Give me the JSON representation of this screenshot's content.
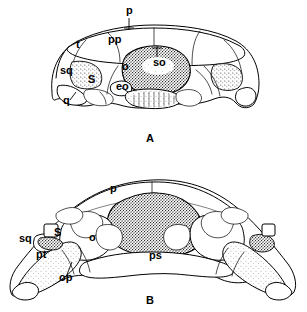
{
  "figure": {
    "background_color": "#ffffff",
    "ink_color": "#000000",
    "panels": [
      {
        "letter": "A",
        "name": "panel-a",
        "description": "Occipital view of skull, dorsal aspect outline with stippled supraoccipital",
        "labels": [
          {
            "text": "p",
            "name": "label-p",
            "x": 126,
            "y": 14,
            "leader": true
          },
          {
            "text": "pp",
            "name": "label-pp",
            "x": 108,
            "y": 43,
            "leader": false
          },
          {
            "text": "t",
            "name": "label-t",
            "x": 76,
            "y": 48,
            "leader": false
          },
          {
            "text": "sq",
            "name": "label-sq",
            "x": 60,
            "y": 74,
            "leader": false
          },
          {
            "text": "q",
            "name": "label-q",
            "x": 63,
            "y": 104,
            "leader": true
          },
          {
            "text": "S",
            "name": "label-s",
            "x": 88,
            "y": 83,
            "leader": false
          },
          {
            "text": "o",
            "name": "label-o",
            "x": 122,
            "y": 70,
            "leader": false
          },
          {
            "text": "so",
            "name": "label-so",
            "x": 153,
            "y": 66,
            "leader": true
          },
          {
            "text": "eo",
            "name": "label-eo",
            "x": 116,
            "y": 90,
            "leader": true
          }
        ]
      },
      {
        "letter": "B",
        "name": "panel-b",
        "description": "Ventral view of braincase with pterygoid and parasphenoid, stippled central element",
        "labels": [
          {
            "text": "p",
            "name": "label-p",
            "x": 110,
            "y": 192,
            "leader": false
          },
          {
            "text": "sq",
            "name": "label-sq",
            "x": 19,
            "y": 242,
            "leader": false
          },
          {
            "text": "S",
            "name": "label-s",
            "x": 54,
            "y": 236,
            "leader": false
          },
          {
            "text": "pt",
            "name": "label-pt",
            "x": 36,
            "y": 258,
            "leader": false
          },
          {
            "text": "op",
            "name": "label-op",
            "x": 59,
            "y": 281,
            "leader": true
          },
          {
            "text": "o",
            "name": "label-o",
            "x": 89,
            "y": 241,
            "leader": false
          },
          {
            "text": "ps",
            "name": "label-ps",
            "x": 149,
            "y": 259,
            "leader": false
          }
        ]
      }
    ],
    "abbreviations": [
      "p",
      "pp",
      "t",
      "sq",
      "q",
      "S",
      "o",
      "so",
      "eo",
      "pt",
      "op",
      "ps"
    ]
  }
}
